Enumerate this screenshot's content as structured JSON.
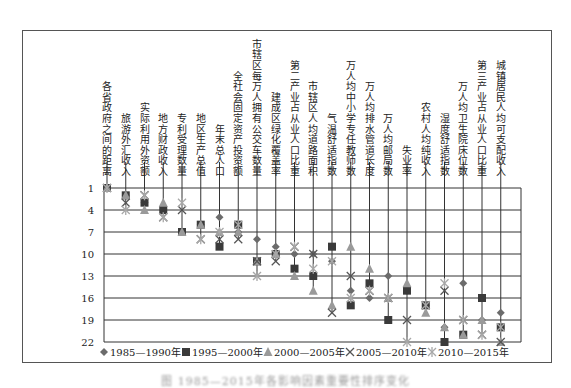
{
  "chart_data": {
    "type": "scatter",
    "title": "",
    "xlabel": "",
    "ylabel": "",
    "y_axis": {
      "ticks": [
        1,
        4,
        7,
        10,
        13,
        16,
        19,
        22
      ],
      "range": [
        1,
        22
      ],
      "inverted": true
    },
    "grid": true,
    "legend_position": "bottom",
    "categories": [
      "各省政府之间的距离",
      "旅游外汇收入",
      "实际利用外资额",
      "地方财政收入",
      "专利受理数量",
      "地区生产总值",
      "年末总人口",
      "全社会固定资产投资额",
      "市辖区每万人拥有公交车数量",
      "建成区绿化覆盖率",
      "第二产业占从业人口比重",
      "市辖区人均道路面积",
      "气温舒适指数",
      "万人均中小学专任教师数",
      "万人均排水管道长度",
      "万人均邮局数",
      "失业率",
      "农村人均纯收入",
      "湿度舒适指数",
      "万人均卫生院床位数",
      "第三产业占从业人口比重",
      "城镇居民人均可支配收入"
    ],
    "series": [
      {
        "name": "1985—1990年",
        "marker": "diamond",
        "color": "#6b6b6b",
        "values": [
          1,
          2,
          3,
          4,
          7,
          6,
          5,
          7,
          8,
          9,
          10,
          10,
          11,
          15,
          16,
          13,
          15,
          17,
          20,
          14,
          19,
          18
        ]
      },
      {
        "name": "1995—2000年",
        "marker": "square",
        "color": "#3a3a3a",
        "values": [
          1,
          2,
          3,
          4,
          7,
          6,
          9,
          6,
          11,
          10,
          12,
          13,
          9,
          17,
          14,
          19,
          15,
          17,
          22,
          21,
          16,
          20
        ]
      },
      {
        "name": "2000—2005年",
        "marker": "triangle",
        "color": "#9a9a9a",
        "values": [
          1,
          2,
          4,
          3,
          7,
          6,
          7,
          7,
          11,
          10,
          13,
          15,
          17,
          9,
          12,
          16,
          14,
          18,
          20,
          21,
          19,
          22
        ]
      },
      {
        "name": "2005—2010年",
        "marker": "x",
        "color": "#555555",
        "values": [
          1,
          3,
          2,
          5,
          4,
          8,
          8,
          8,
          11,
          11,
          9,
          10,
          18,
          13,
          15,
          16,
          19,
          17,
          15,
          19,
          21,
          22
        ]
      },
      {
        "name": "2010—2015年",
        "marker": "asterisk",
        "color": "#a8a8a8",
        "values": [
          1,
          4,
          2,
          5,
          3,
          8,
          7,
          6,
          13,
          10,
          9,
          12,
          11,
          16,
          15,
          16,
          22,
          17,
          14,
          19,
          21,
          20
        ]
      }
    ]
  },
  "legend": {
    "items": [
      {
        "symbol": "◆",
        "label": "1985—1990年"
      },
      {
        "symbol": "■",
        "label": "1995—2000年"
      },
      {
        "symbol": "▲",
        "label": "2000—2005年"
      },
      {
        "symbol": "✕",
        "label": "2005—2010年"
      },
      {
        "symbol": "✳",
        "label": "2010—2015年"
      }
    ]
  },
  "caption": "图 1985—2015年各影响因素重要性排序变化"
}
